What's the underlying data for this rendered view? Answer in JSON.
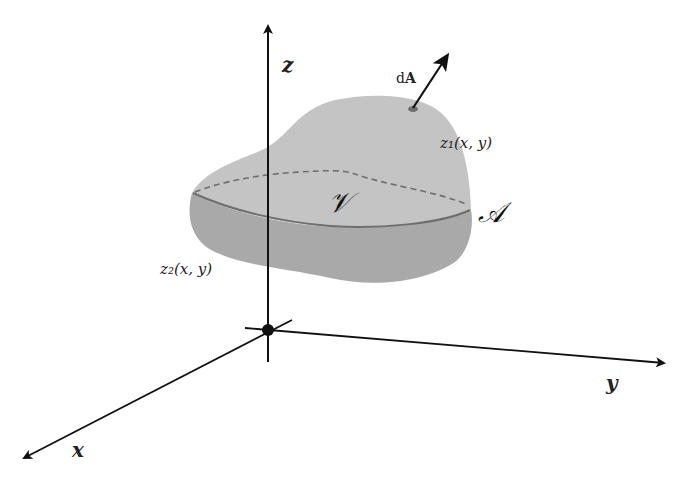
{
  "diagram": {
    "axes": {
      "x_label": "x",
      "y_label": "y",
      "z_label": "z"
    },
    "labels": {
      "volume": "𝒱",
      "surface": "𝒜",
      "area_element_d": "d",
      "area_element_A": "A",
      "upper_surface": "z₁(x, y)",
      "lower_surface": "z₂(x, y)"
    },
    "colors": {
      "upper_fill": "#c4c4c4",
      "lower_fill": "#a8a8a8",
      "rim_line": "#6f6f6f",
      "dashed_line": "#6f6f6f",
      "axes": "#111111",
      "background": "#ffffff"
    }
  }
}
